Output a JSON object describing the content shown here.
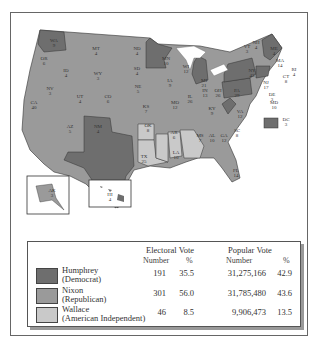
{
  "colors": {
    "democrat": "#6e6e6e",
    "republican": "#9a9a9a",
    "independent": "#c9c9c9",
    "water": "#ffffff"
  },
  "states": [
    {
      "abbr": "WA",
      "ev": "9",
      "party": "democrat"
    },
    {
      "abbr": "OR",
      "ev": "6",
      "party": "republican"
    },
    {
      "abbr": "CA",
      "ev": "40",
      "party": "republican"
    },
    {
      "abbr": "ID",
      "ev": "4",
      "party": "republican"
    },
    {
      "abbr": "NV",
      "ev": "3",
      "party": "republican"
    },
    {
      "abbr": "MT",
      "ev": "4",
      "party": "republican"
    },
    {
      "abbr": "WY",
      "ev": "3",
      "party": "republican"
    },
    {
      "abbr": "UT",
      "ev": "4",
      "party": "republican"
    },
    {
      "abbr": "AZ",
      "ev": "5",
      "party": "republican"
    },
    {
      "abbr": "CO",
      "ev": "6",
      "party": "republican"
    },
    {
      "abbr": "NM",
      "ev": "4",
      "party": "republican"
    },
    {
      "abbr": "ND",
      "ev": "4",
      "party": "republican"
    },
    {
      "abbr": "SD",
      "ev": "4",
      "party": "republican"
    },
    {
      "abbr": "NE",
      "ev": "5",
      "party": "republican"
    },
    {
      "abbr": "KS",
      "ev": "7",
      "party": "republican"
    },
    {
      "abbr": "OK",
      "ev": "8",
      "party": "republican"
    },
    {
      "abbr": "TX",
      "ev": "25",
      "party": "democrat"
    },
    {
      "abbr": "MN",
      "ev": "10",
      "party": "democrat"
    },
    {
      "abbr": "IA",
      "ev": "9",
      "party": "republican"
    },
    {
      "abbr": "MO",
      "ev": "12",
      "party": "republican"
    },
    {
      "abbr": "AR",
      "ev": "6",
      "party": "independent"
    },
    {
      "abbr": "LA",
      "ev": "10",
      "party": "independent"
    },
    {
      "abbr": "WI",
      "ev": "12",
      "party": "republican"
    },
    {
      "abbr": "IL",
      "ev": "26",
      "party": "republican"
    },
    {
      "abbr": "MI",
      "ev": "21",
      "party": "democrat"
    },
    {
      "abbr": "IN",
      "ev": "13",
      "party": "republican"
    },
    {
      "abbr": "OH",
      "ev": "26",
      "party": "republican"
    },
    {
      "abbr": "KY",
      "ev": "9",
      "party": "republican"
    },
    {
      "abbr": "TN",
      "ev": "11",
      "party": "republican"
    },
    {
      "abbr": "MS",
      "ev": "7",
      "party": "independent"
    },
    {
      "abbr": "AL",
      "ev": "10",
      "party": "independent"
    },
    {
      "abbr": "GA",
      "ev": "12",
      "party": "independent"
    },
    {
      "abbr": "FL",
      "ev": "14",
      "party": "republican"
    },
    {
      "abbr": "SC",
      "ev": "8",
      "party": "republican"
    },
    {
      "abbr": "NC",
      "ev": "12 W 1",
      "party": "republican"
    },
    {
      "abbr": "VA",
      "ev": "12",
      "party": "republican"
    },
    {
      "abbr": "WV",
      "ev": "7",
      "party": "democrat"
    },
    {
      "abbr": "PA",
      "ev": "29",
      "party": "democrat"
    },
    {
      "abbr": "NY",
      "ev": "43",
      "party": "democrat"
    },
    {
      "abbr": "ME",
      "ev": "4",
      "party": "democrat"
    },
    {
      "abbr": "NH",
      "ev": "4",
      "party": "republican"
    },
    {
      "abbr": "VT",
      "ev": "3",
      "party": "republican"
    },
    {
      "abbr": "MA",
      "ev": "14",
      "party": "democrat"
    },
    {
      "abbr": "RI",
      "ev": "4",
      "party": "democrat"
    },
    {
      "abbr": "CT",
      "ev": "8",
      "party": "democrat"
    },
    {
      "abbr": "NJ",
      "ev": "17",
      "party": "republican"
    },
    {
      "abbr": "DE",
      "ev": "3",
      "party": "republican"
    },
    {
      "abbr": "MD",
      "ev": "10",
      "party": "democrat"
    },
    {
      "abbr": "DC",
      "ev": "3",
      "party": "democrat"
    },
    {
      "abbr": "AK",
      "ev": "3",
      "party": "republican"
    },
    {
      "abbr": "HI",
      "ev": "4",
      "party": "democrat"
    }
  ],
  "legend": {
    "header_electoral": "Electoral Vote",
    "header_popular": "Popular Vote",
    "sub_number": "Number",
    "sub_percent": "%",
    "rows": [
      {
        "name": "Humphrey",
        "party": "(Democrat)",
        "ev": "191",
        "ev_pct": "35.5",
        "pop": "31,275,166",
        "pop_pct": "42.9"
      },
      {
        "name": "Nixon",
        "party": "(Republican)",
        "ev": "301",
        "ev_pct": "56.0",
        "pop": "31,785,480",
        "pop_pct": "43.6"
      },
      {
        "name": "Wallace",
        "party": "(American Independent)",
        "ev": "46",
        "ev_pct": "8.5",
        "pop": "9,906,473",
        "pop_pct": "13.5"
      }
    ]
  }
}
